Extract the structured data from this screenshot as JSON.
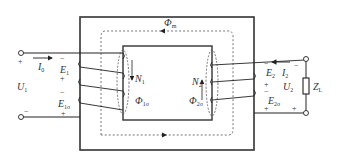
{
  "diagram": {
    "type": "single-phase transformer equivalent winding diagram",
    "colors": {
      "line": "#2a2a2a",
      "core": "#333333",
      "dashed": "#555555",
      "background": "#ffffff"
    },
    "labels": {
      "main_flux": "Φ",
      "main_flux_sub": "m",
      "primary_current": "I",
      "primary_current_sub": "0",
      "primary_emf": "E",
      "primary_emf_sub": "1",
      "primary_voltage": "U",
      "primary_voltage_sub": "1",
      "primary_leak_emf": "E",
      "primary_leak_emf_sub": "1σ",
      "primary_turns": "N",
      "primary_turns_sub": "1",
      "primary_leak_flux": "Φ",
      "primary_leak_flux_sub": "1σ",
      "secondary_turns": "N",
      "secondary_turns_sub": "2",
      "secondary_leak_flux": "Φ",
      "secondary_leak_flux_sub": "2σ",
      "secondary_emf": "E",
      "secondary_emf_sub": "2",
      "secondary_current": "I",
      "secondary_current_sub": "2",
      "secondary_voltage": "U",
      "secondary_voltage_sub": "2",
      "secondary_leak_emf": "E",
      "secondary_leak_emf_sub": "2σ",
      "load": "Z",
      "load_sub": "L"
    },
    "polarity": {
      "plus": "+",
      "minus": "−"
    }
  }
}
